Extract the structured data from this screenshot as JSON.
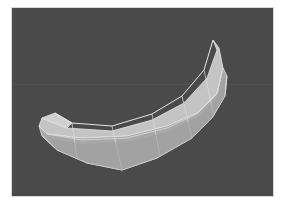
{
  "viewport": {
    "background": "#4a4a4a",
    "border": "#d8d8d8",
    "horizon_color": "#525252",
    "object": {
      "name": "curved-banana-mesh",
      "shading": "smooth-with-wireframe",
      "fill_light": "#c8c8c8",
      "fill_mid": "#b4b4b4",
      "fill_dark": "#9a9a9a",
      "edge_color": "#e6e6e6"
    }
  }
}
